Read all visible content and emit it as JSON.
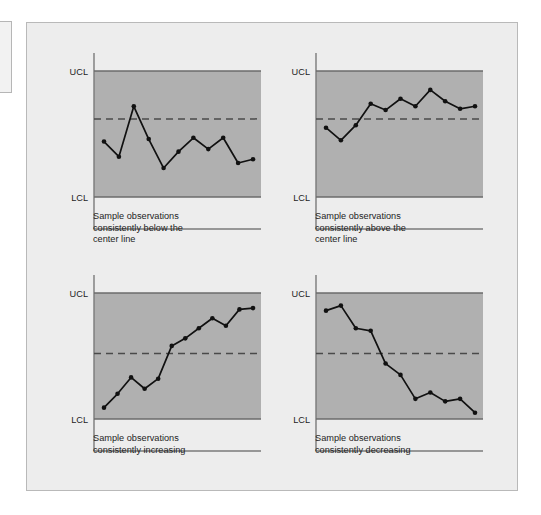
{
  "figure": {
    "background_color": "#ededed",
    "panel_border_color": "#b9b9b9",
    "band_fill_color": "#b0b0b0",
    "line_color": "#111111",
    "limit_line_color": "#6b6b6b",
    "center_line_color": "#4a4a4a",
    "axis_color": "#7a7a7a"
  },
  "labels": {
    "ucl": "UCL",
    "lcl": "LCL"
  },
  "charts": [
    {
      "id": "below-center-line",
      "caption": "Sample observations\nconsistently below the\ncenter line"
    },
    {
      "id": "above-center-line",
      "caption": "Sample observations\nconsistently above the\ncenter line"
    },
    {
      "id": "increasing",
      "caption": "Sample observations\nconsistently increasing"
    },
    {
      "id": "decreasing",
      "caption": "Sample observations\nconsistently decreasing"
    }
  ],
  "chart_data": [
    {
      "type": "line",
      "title": "Sample observations consistently below the center line",
      "xlabel": "",
      "ylabel": "",
      "ylim": [
        0,
        1
      ],
      "grid": false,
      "legend": null,
      "annotations": [
        "UCL",
        "LCL",
        "center line (dashed)"
      ],
      "reference_lines": {
        "UCL": 1.0,
        "center": 0.62,
        "LCL": 0.0
      },
      "x": [
        1,
        2,
        3,
        4,
        5,
        6,
        7,
        8,
        9,
        10,
        11,
        12
      ],
      "values": [
        0.44,
        0.32,
        0.72,
        0.46,
        0.23,
        0.36,
        0.47,
        0.38,
        0.47,
        0.27,
        0.3
      ]
    },
    {
      "type": "line",
      "title": "Sample observations consistently above the center line",
      "xlabel": "",
      "ylabel": "",
      "ylim": [
        0,
        1
      ],
      "grid": false,
      "legend": null,
      "annotations": [
        "UCL",
        "LCL",
        "center line (dashed)"
      ],
      "reference_lines": {
        "UCL": 1.0,
        "center": 0.62,
        "LCL": 0.0
      },
      "x": [
        1,
        2,
        3,
        4,
        5,
        6,
        7,
        8,
        9,
        10,
        11
      ],
      "values": [
        0.55,
        0.45,
        0.57,
        0.74,
        0.69,
        0.78,
        0.72,
        0.85,
        0.76,
        0.7,
        0.72
      ]
    },
    {
      "type": "line",
      "title": "Sample observations consistently increasing",
      "xlabel": "",
      "ylabel": "",
      "ylim": [
        0,
        1
      ],
      "grid": false,
      "legend": null,
      "annotations": [
        "UCL",
        "LCL",
        "center line (dashed)"
      ],
      "reference_lines": {
        "UCL": 1.0,
        "center": 0.52,
        "LCL": 0.0
      },
      "x": [
        1,
        2,
        3,
        4,
        5,
        6,
        7,
        8,
        9,
        10,
        11
      ],
      "values": [
        0.09,
        0.2,
        0.33,
        0.24,
        0.32,
        0.58,
        0.64,
        0.72,
        0.8,
        0.74,
        0.87,
        0.88
      ]
    },
    {
      "type": "line",
      "title": "Sample observations consistently decreasing",
      "xlabel": "",
      "ylabel": "",
      "ylim": [
        0,
        1
      ],
      "grid": false,
      "legend": null,
      "annotations": [
        "UCL",
        "LCL",
        "center line (dashed)"
      ],
      "reference_lines": {
        "UCL": 1.0,
        "center": 0.52,
        "LCL": 0.0
      },
      "x": [
        1,
        2,
        3,
        4,
        5,
        6,
        7,
        8,
        9,
        10,
        11
      ],
      "values": [
        0.86,
        0.9,
        0.72,
        0.7,
        0.44,
        0.35,
        0.16,
        0.21,
        0.14,
        0.16,
        0.05
      ]
    }
  ]
}
